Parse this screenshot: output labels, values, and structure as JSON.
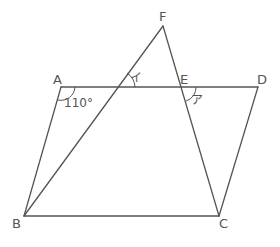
{
  "diagram": {
    "type": "geometry",
    "points": {
      "A": "A",
      "B": "B",
      "C": "C",
      "D": "D",
      "E": "E",
      "F": "F"
    },
    "segments": [
      "AD",
      "BC",
      "AB",
      "DC",
      "BF",
      "FC"
    ],
    "angles": {
      "angle_A": "110°",
      "angle_i": "イ",
      "angle_a": "ア"
    },
    "stroke_color": "#555555"
  }
}
